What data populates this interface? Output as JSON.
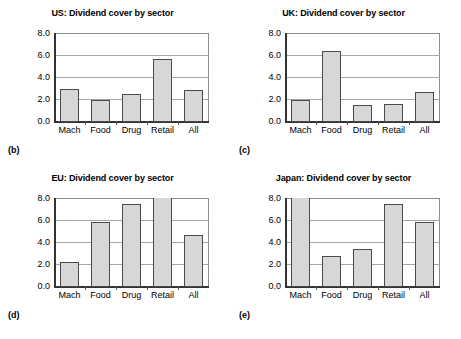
{
  "figure": {
    "background": "#ffffff",
    "bar_fill": "#d7d7d7",
    "bar_edge": "#4a4a4a",
    "grid_color": "#a6a6a6"
  },
  "panels": [
    {
      "tag": "(b)",
      "chart_data": {
        "type": "bar",
        "title": "US: Dividend cover by sector",
        "categories": [
          "Mach",
          "Food",
          "Drug",
          "Retail",
          "All"
        ],
        "values": [
          3.0,
          2.0,
          2.5,
          5.7,
          2.9
        ],
        "xlabel": "",
        "ylabel": "",
        "ylim": [
          0.0,
          8.0
        ],
        "yticks": [
          "0.0",
          "2.0",
          "4.0",
          "6.0",
          "8.0"
        ],
        "ytick_values": [
          0.0,
          2.0,
          4.0,
          6.0,
          8.0
        ],
        "grid": true,
        "legend": "none",
        "clipped": []
      }
    },
    {
      "tag": "(c)",
      "chart_data": {
        "type": "bar",
        "title": "UK: Dividend cover by sector",
        "categories": [
          "Mach",
          "Food",
          "Drug",
          "Retail",
          "All"
        ],
        "values": [
          1.95,
          6.4,
          1.5,
          1.55,
          2.65
        ],
        "xlabel": "",
        "ylabel": "",
        "ylim": [
          0.0,
          8.0
        ],
        "yticks": [
          "0.0",
          "2.0",
          "4.0",
          "6.0",
          "8.0"
        ],
        "ytick_values": [
          0.0,
          2.0,
          4.0,
          6.0,
          8.0
        ],
        "grid": true,
        "legend": "none",
        "clipped": []
      }
    },
    {
      "tag": "(d)",
      "chart_data": {
        "type": "bar",
        "title": "EU: Dividend cover by sector",
        "categories": [
          "Mach",
          "Food",
          "Drug",
          "Retail",
          "All"
        ],
        "values": [
          2.2,
          5.85,
          7.5,
          8.0,
          4.7
        ],
        "xlabel": "",
        "ylabel": "",
        "ylim": [
          0.0,
          8.0
        ],
        "yticks": [
          "0.0",
          "2.0",
          "4.0",
          "6.0",
          "8.0"
        ],
        "ytick_values": [
          0.0,
          2.0,
          4.0,
          6.0,
          8.0
        ],
        "grid": true,
        "legend": "none",
        "clipped": [
          "Retail"
        ]
      }
    },
    {
      "tag": "(e)",
      "chart_data": {
        "type": "bar",
        "title": "Japan: Dividend cover by sector",
        "categories": [
          "Mach",
          "Food",
          "Drug",
          "Retail",
          "All"
        ],
        "values": [
          8.0,
          2.75,
          3.45,
          7.5,
          5.9
        ],
        "xlabel": "",
        "ylabel": "",
        "ylim": [
          0.0,
          8.0
        ],
        "yticks": [
          "0.0",
          "2.0",
          "4.0",
          "6.0",
          "8.0"
        ],
        "ytick_values": [
          0.0,
          2.0,
          4.0,
          6.0,
          8.0
        ],
        "grid": true,
        "legend": "none",
        "clipped": [
          "Mach"
        ]
      }
    }
  ]
}
